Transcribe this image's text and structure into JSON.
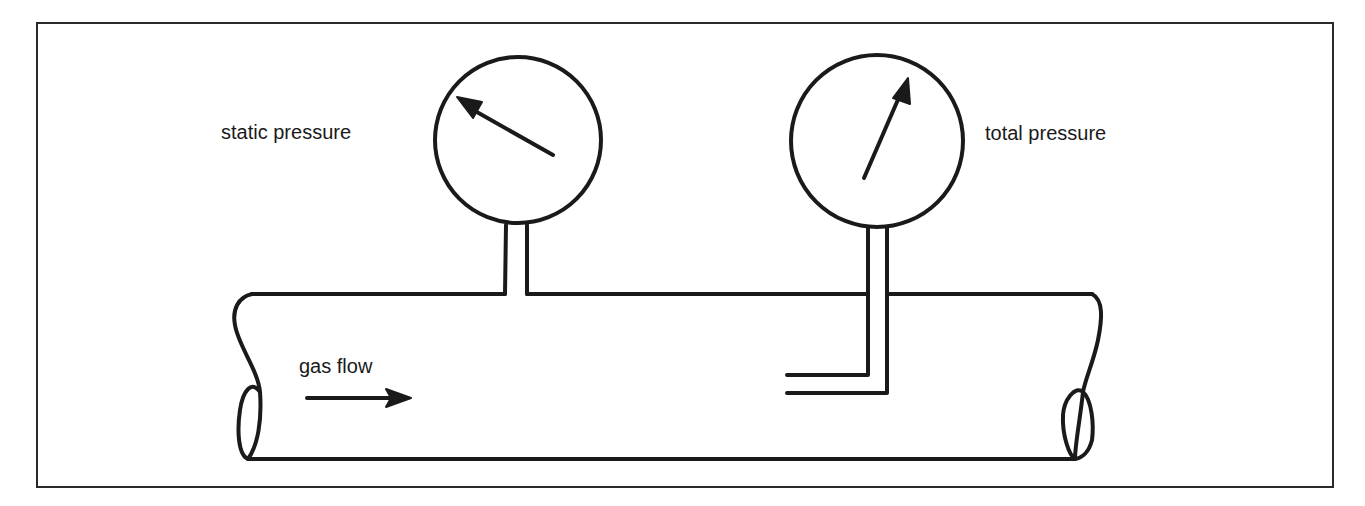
{
  "diagram": {
    "title": "",
    "labels": {
      "static": "static pressure",
      "total": "total pressure",
      "flow": "gas flow"
    },
    "colors": {
      "stroke": "#1a1a1a",
      "frame": "#2a2a2a",
      "background": "#ffffff"
    },
    "components": [
      {
        "id": "pipe",
        "type": "pipe",
        "description": "horizontal pipe with broken ends"
      },
      {
        "id": "static-gauge",
        "type": "gauge",
        "reading": "needle pointing upper-left",
        "tap": "wall tap"
      },
      {
        "id": "total-gauge",
        "type": "gauge",
        "reading": "needle pointing upper-right",
        "tap": "pitot tube facing flow"
      },
      {
        "id": "flow-arrow",
        "type": "arrow",
        "direction": "right"
      }
    ]
  }
}
